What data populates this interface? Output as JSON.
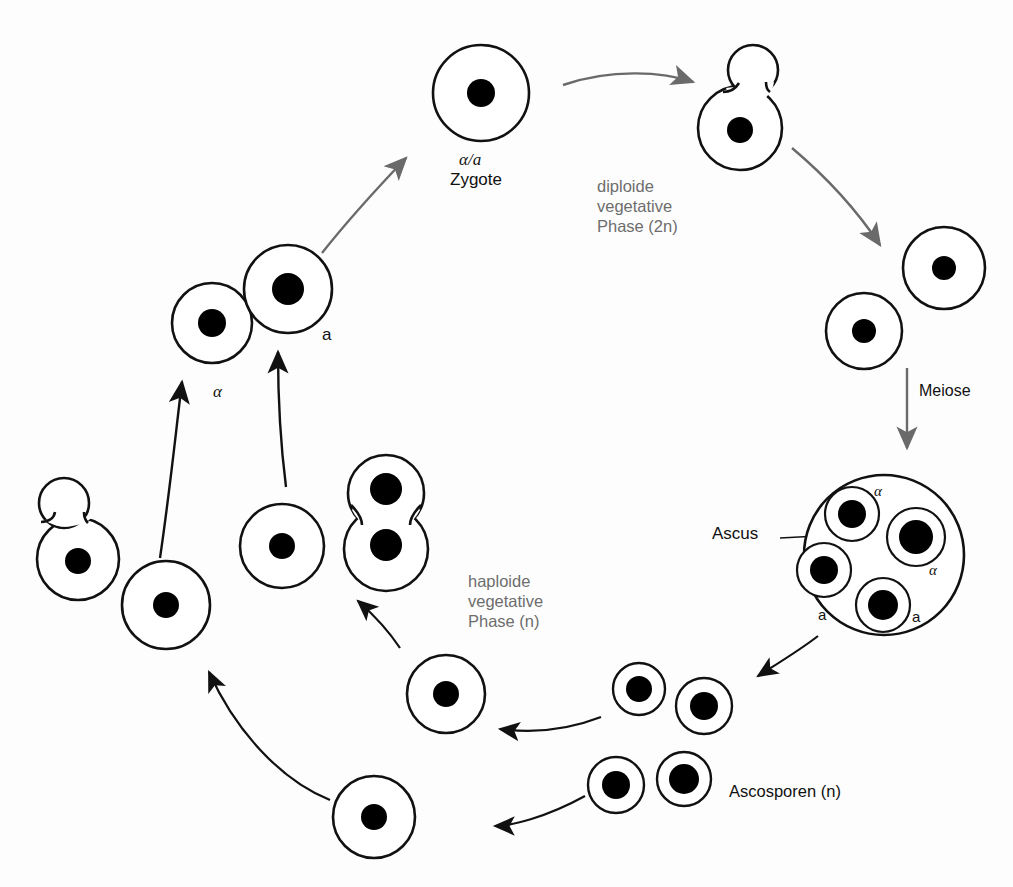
{
  "diagram": {
    "labels": {
      "zygote_sym": "α/a",
      "zygote_name": "Zygote",
      "diploid_phase": "diploide\nvegetative\nPhase (2n)",
      "meiose": "Meiose",
      "ascus": "Ascus",
      "ascospores": "Ascosporen (n)",
      "haploid_phase": "haploide\nvegetative\nPhase (n)",
      "alpha_cell": "α",
      "a_cell": "a",
      "ascus_spore_alpha_1": "α",
      "ascus_spore_alpha_2": "α",
      "ascus_spore_a_1": "a",
      "ascus_spore_a_2": "a"
    },
    "colors": {
      "outline": "#111111",
      "nucleus": "#000000",
      "cytoplasm": "#ffffff",
      "gray_arrow": "#6a6a6a",
      "black_arrow": "#111111",
      "gray_text": "#6d6d6d",
      "black_text": "#111111",
      "background": "#fdfdfd"
    },
    "cells": [
      {
        "name": "zygote",
        "cx": 481,
        "cy": 93,
        "r": 48,
        "nucleus_r": 14,
        "type": "round"
      },
      {
        "name": "diploid-budding-cell",
        "cx": 740,
        "cy": 128,
        "r": 42,
        "nucleus_r": 13,
        "type": "budding"
      },
      {
        "name": "diploid-daughter-upper",
        "cx": 944,
        "cy": 268,
        "r": 41,
        "nucleus_r": 12,
        "type": "round"
      },
      {
        "name": "diploid-daughter-lower",
        "cx": 864,
        "cy": 331,
        "r": 38,
        "nucleus_r": 12,
        "type": "round"
      },
      {
        "name": "ascus",
        "cx": 884,
        "cy": 555,
        "r": 80,
        "type": "ascus"
      },
      {
        "name": "ascospore-free-1",
        "cx": 639,
        "cy": 689,
        "r": 26,
        "nucleus_r": 13,
        "type": "spore"
      },
      {
        "name": "ascospore-free-2",
        "cx": 704,
        "cy": 706,
        "r": 28,
        "nucleus_r": 14,
        "type": "spore"
      },
      {
        "name": "ascospore-free-3",
        "cx": 616,
        "cy": 785,
        "r": 28,
        "nucleus_r": 14,
        "type": "spore"
      },
      {
        "name": "ascospore-free-4",
        "cx": 684,
        "cy": 779,
        "r": 27,
        "nucleus_r": 15,
        "type": "spore"
      },
      {
        "name": "haploid-cell-lower-left",
        "cx": 374,
        "cy": 817,
        "r": 41,
        "nucleus_r": 13,
        "type": "round"
      },
      {
        "name": "haploid-cell-mid-right",
        "cx": 446,
        "cy": 694,
        "r": 39,
        "nucleus_r": 13,
        "type": "round"
      },
      {
        "name": "haploid-dividing-cell",
        "cx": 386,
        "cy": 536,
        "r": 39,
        "type": "dividing"
      },
      {
        "name": "haploid-cell-center",
        "cx": 282,
        "cy": 546,
        "r": 42,
        "nucleus_r": 13,
        "type": "round"
      },
      {
        "name": "haploid-cell-left",
        "cx": 166,
        "cy": 605,
        "r": 44,
        "nucleus_r": 13,
        "type": "round"
      },
      {
        "name": "haploid-budding-left",
        "cx": 78,
        "cy": 559,
        "r": 41,
        "nucleus_r": 13,
        "type": "budding"
      },
      {
        "name": "alpha-mating-cell",
        "cx": 212,
        "cy": 323,
        "r": 40,
        "nucleus_r": 14,
        "type": "round"
      },
      {
        "name": "a-mating-cell",
        "cx": 288,
        "cy": 289,
        "r": 44,
        "nucleus_r": 16,
        "type": "round"
      }
    ],
    "ascus_spores": [
      {
        "name": "ascus-spore-alpha-top",
        "cx": 852,
        "cy": 514,
        "r": 27,
        "nucleus_r": 14
      },
      {
        "name": "ascus-spore-alpha-right",
        "cx": 916,
        "cy": 537,
        "r": 29,
        "nucleus_r": 17
      },
      {
        "name": "ascus-spore-a-left",
        "cx": 824,
        "cy": 570,
        "r": 27,
        "nucleus_r": 14
      },
      {
        "name": "ascus-spore-a-bottom",
        "cx": 883,
        "cy": 605,
        "r": 27,
        "nucleus_r": 15
      }
    ],
    "arrows": [
      {
        "name": "arrow-mating-to-zygote",
        "color": "gray",
        "from": "a-mating-cell",
        "to": "zygote"
      },
      {
        "name": "arrow-zygote-to-budding",
        "color": "gray",
        "from": "zygote",
        "to": "diploid-budding-cell"
      },
      {
        "name": "arrow-budding-to-daughters",
        "color": "gray",
        "from": "diploid-budding-cell",
        "to": "diploid-daughters"
      },
      {
        "name": "arrow-meiose",
        "color": "gray",
        "from": "diploid-daughter-lower",
        "to": "ascus",
        "label": "Meiose"
      },
      {
        "name": "arrow-ascus-to-spores",
        "color": "black",
        "from": "ascus",
        "to": "ascospores"
      },
      {
        "name": "arrow-spores-to-haploid",
        "color": "black",
        "from": "ascospores",
        "to": "haploid-cell-mid-right"
      },
      {
        "name": "arrow-bottom-left",
        "color": "black",
        "from": "ascospore-free-3",
        "to": "haploid-cell-lower-left"
      },
      {
        "name": "arrow-haploid-up-left",
        "color": "black",
        "from": "haploid-cell-lower-left",
        "to": "haploid-cell-left"
      },
      {
        "name": "arrow-to-dividing-cell",
        "color": "black",
        "from": "haploid-cell-mid-right",
        "to": "haploid-dividing-cell"
      },
      {
        "name": "arrow-alpha-up",
        "color": "black",
        "from": "haploid-cell-left",
        "to": "alpha-mating-cell"
      },
      {
        "name": "arrow-a-up",
        "color": "black",
        "from": "haploid-cell-center",
        "to": "a-mating-cell"
      },
      {
        "name": "arrow-ascus-leader",
        "color": "black",
        "from": "ascus-label",
        "to": "ascus"
      }
    ]
  }
}
